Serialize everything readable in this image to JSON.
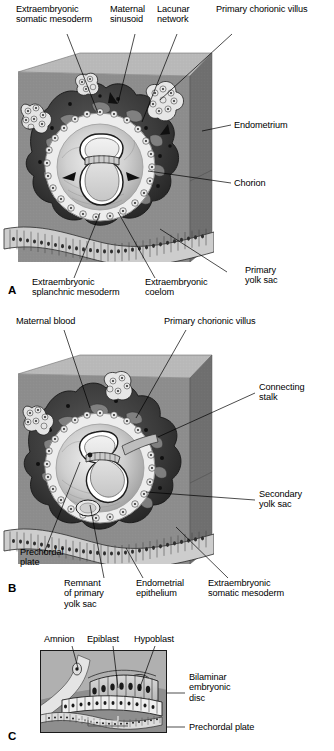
{
  "figure": {
    "panels": [
      {
        "id": "A",
        "letter": "A",
        "labels": [
          {
            "name": "extraembryonic-somatic-mesoderm",
            "text": "Extraembryonic\nsomatic mesoderm"
          },
          {
            "name": "maternal-sinusoid",
            "text": "Maternal\nsinusoid"
          },
          {
            "name": "lacunar-network",
            "text": "Lacunar\nnetwork"
          },
          {
            "name": "primary-chorionic-villus",
            "text": "Primary chorionic villus"
          },
          {
            "name": "endometrium",
            "text": "Endometrium"
          },
          {
            "name": "chorion",
            "text": "Chorion"
          },
          {
            "name": "extraembryonic-splanchnic-mesoderm",
            "text": "Extraembryonic\nsplanchnic mesoderm"
          },
          {
            "name": "extraembryonic-coelom",
            "text": "Extraembryonic\ncoelom"
          },
          {
            "name": "primary-yolk-sac",
            "text": "Primary\nyolk sac"
          }
        ]
      },
      {
        "id": "B",
        "letter": "B",
        "labels": [
          {
            "name": "maternal-blood",
            "text": "Maternal blood"
          },
          {
            "name": "primary-chorionic-villus",
            "text": "Primary chorionic villus"
          },
          {
            "name": "connecting-stalk",
            "text": "Connecting\nstalk"
          },
          {
            "name": "secondary-yolk-sac",
            "text": "Secondary\nyolk sac"
          },
          {
            "name": "prechordal-plate",
            "text": "Prechordal\nplate"
          },
          {
            "name": "remnant-of-primary-yolk-sac",
            "text": "Remnant\nof primary\nyolk sac"
          },
          {
            "name": "endometrial-epithelium",
            "text": "Endometrial\nepithelium"
          },
          {
            "name": "extraembryonic-somatic-mesoderm",
            "text": "Extraembryonic\nsomatic mesoderm"
          }
        ]
      },
      {
        "id": "C",
        "letter": "C",
        "labels": [
          {
            "name": "amnion",
            "text": "Amnion"
          },
          {
            "name": "epiblast",
            "text": "Epiblast"
          },
          {
            "name": "hypoblast",
            "text": "Hypoblast"
          },
          {
            "name": "bilaminar-embryonic-disc",
            "text": "Bilaminar\nembryonic\ndisc"
          },
          {
            "name": "prechordal-plate",
            "text": "Prechordal plate"
          }
        ]
      }
    ],
    "colors": {
      "block_front": "#8d8d8d",
      "block_top": "#b9b9b9",
      "block_side": "#6e6e6e",
      "trophoblast_dark": "#2a2a2a",
      "syncytio_mid": "#4a4a4a",
      "cavity_light": "#d8d8d8",
      "epithelium": "#c9c9c9",
      "leader_line": "#000000",
      "text": "#000000",
      "background": "#ffffff"
    }
  }
}
